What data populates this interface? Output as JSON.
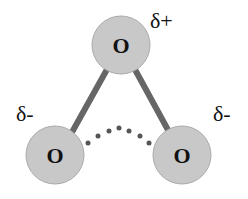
{
  "atoms": [
    {
      "id": "top",
      "label": "O",
      "cx": 121,
      "cy": 45,
      "r": 29
    },
    {
      "id": "left",
      "label": "O",
      "cx": 55,
      "cy": 155,
      "r": 29
    },
    {
      "id": "right",
      "label": "O",
      "cx": 182,
      "cy": 155,
      "r": 29
    }
  ],
  "charges": {
    "top": "δ+",
    "left": "δ-",
    "right": "δ-"
  },
  "colors": {
    "atom_fill": "#c8c8c8",
    "atom_stroke": "#a8a8a8",
    "bond": "#666666",
    "dots": "#555555",
    "text": "#111111"
  }
}
